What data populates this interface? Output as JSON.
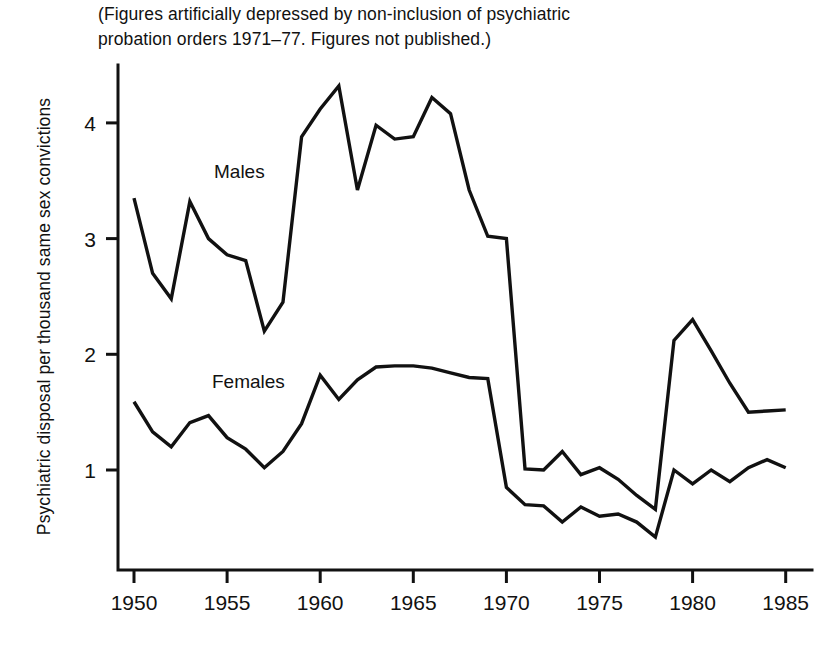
{
  "figure": {
    "note": "(Figures artificially depressed by non-inclusion of psychiatric\nprobation orders 1971–77. Figures not published.)",
    "ylabel": "Psychiatric disposal per thousand same sex convictions",
    "series_label_males": "Males",
    "series_label_females": "Females",
    "ink_color": "#111111",
    "background_color": "#ffffff"
  },
  "chart_data": {
    "type": "line",
    "title": "(Figures artificially depressed by non-inclusion of psychiatric probation orders 1971–77. Figures not published.)",
    "xlabel": "",
    "ylabel": "Psychiatric disposal per thousand same sex convictions",
    "xlim": [
      1950,
      1985
    ],
    "ylim": [
      0,
      4.6
    ],
    "xticks": [
      1950,
      1955,
      1960,
      1965,
      1970,
      1975,
      1980,
      1985
    ],
    "xticklabels": [
      "1950",
      "1955",
      "1960",
      "1965",
      "1970",
      "1975",
      "1980",
      "1985"
    ],
    "yticks": [
      1,
      2,
      3,
      4
    ],
    "yticklabels": [
      "1",
      "2",
      "3",
      "4"
    ],
    "grid": false,
    "legend": "inline-annotations",
    "x": [
      1950,
      1951,
      1952,
      1953,
      1954,
      1955,
      1956,
      1957,
      1958,
      1959,
      1960,
      1961,
      1962,
      1963,
      1964,
      1965,
      1966,
      1967,
      1968,
      1969,
      1970,
      1971,
      1972,
      1973,
      1974,
      1975,
      1976,
      1977,
      1978,
      1979,
      1980,
      1981,
      1982,
      1983,
      1984,
      1985
    ],
    "series": [
      {
        "name": "Males",
        "values": [
          3.35,
          2.7,
          2.48,
          3.32,
          3.0,
          2.86,
          2.81,
          2.2,
          2.45,
          3.88,
          4.12,
          4.32,
          3.42,
          3.98,
          3.86,
          3.88,
          4.22,
          4.08,
          3.42,
          3.02,
          3.0,
          1.01,
          1.0,
          1.16,
          0.96,
          1.02,
          0.92,
          0.78,
          0.66,
          2.12,
          2.3,
          2.03,
          1.75,
          1.5,
          1.51,
          1.52
        ]
      },
      {
        "name": "Females",
        "values": [
          1.59,
          1.33,
          1.2,
          1.41,
          1.47,
          1.28,
          1.18,
          1.02,
          1.16,
          1.4,
          1.82,
          1.61,
          1.78,
          1.89,
          1.9,
          1.9,
          1.88,
          1.84,
          1.8,
          1.79,
          0.85,
          0.7,
          0.69,
          0.55,
          0.68,
          0.6,
          0.62,
          0.55,
          0.42,
          1.0,
          0.88,
          1.0,
          0.9,
          1.02,
          1.09,
          1.02
        ]
      }
    ]
  }
}
